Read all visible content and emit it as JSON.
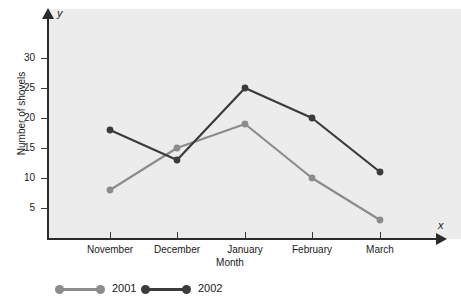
{
  "chart_data": {
    "type": "line",
    "title": "",
    "xlabel": "Month",
    "ylabel": "Number of shovels",
    "x_axis_symbol": "x",
    "y_axis_symbol": "y",
    "categories": [
      "November",
      "December",
      "January",
      "February",
      "March"
    ],
    "ylim": [
      0,
      33
    ],
    "yticks": [
      5,
      10,
      15,
      20,
      25,
      30
    ],
    "ytick_labels": [
      "5",
      "10",
      "15",
      "20",
      "25",
      "30"
    ],
    "grid": false,
    "legend_position": "bottom-left",
    "series": [
      {
        "name": "2001",
        "color": "#8c8c8c",
        "values": [
          8,
          15,
          19,
          10,
          3
        ]
      },
      {
        "name": "2002",
        "color": "#3b3b3b",
        "values": [
          18,
          13,
          25,
          20,
          11
        ]
      }
    ]
  },
  "legend": {
    "items": [
      {
        "label": "2001",
        "color": "#8c8c8c"
      },
      {
        "label": "2002",
        "color": "#3b3b3b"
      }
    ]
  },
  "colors": {
    "panel_background": "#ececec",
    "page_background": "#ffffff",
    "axis": "#2b2b2b",
    "series_2001": "#8c8c8c",
    "series_2002": "#3b3b3b"
  }
}
